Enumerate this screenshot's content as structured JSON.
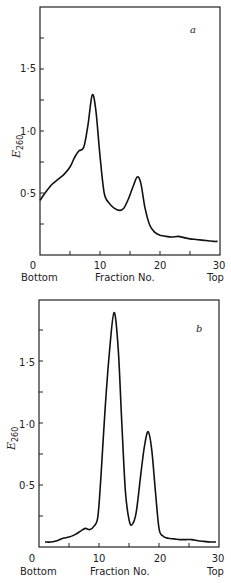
{
  "chart_data": [
    {
      "type": "line",
      "panel": "a",
      "title": "",
      "xlabel": "Fraction No.",
      "xlabel_left": "Bottom",
      "xlabel_right": "Top",
      "ylabel": "E",
      "ylabel_sub": "260",
      "xlim": [
        0,
        30
      ],
      "ylim": [
        0,
        2.0
      ],
      "xticks": [
        0,
        5,
        10,
        15,
        20,
        25,
        30
      ],
      "xtick_labels": [
        "0",
        "10",
        "20",
        "30"
      ],
      "xtick_label_values": [
        0,
        10,
        20,
        30
      ],
      "yticks": [
        0,
        0.25,
        0.5,
        0.75,
        1.0,
        1.25,
        1.5,
        1.75
      ],
      "ytick_labels": [
        "0·5",
        "1·0",
        "1·5"
      ],
      "ytick_label_values": [
        0.5,
        1.0,
        1.5
      ],
      "grid": false,
      "x": [
        0,
        1,
        2,
        3,
        4,
        5,
        5.8,
        6.5,
        7.3,
        8,
        8.7,
        9.3,
        10,
        10.7,
        11.5,
        12.3,
        13.2,
        14,
        14.8,
        15.5,
        16.2,
        16.8,
        17.5,
        18.3,
        19.2,
        20,
        21,
        22,
        23,
        24,
        25,
        26,
        27,
        28,
        29,
        29.6
      ],
      "series": [
        {
          "name": "a",
          "values": [
            0.44,
            0.51,
            0.57,
            0.61,
            0.65,
            0.71,
            0.79,
            0.84,
            0.87,
            1.05,
            1.29,
            1.17,
            0.8,
            0.5,
            0.42,
            0.38,
            0.36,
            0.38,
            0.46,
            0.55,
            0.63,
            0.58,
            0.38,
            0.24,
            0.18,
            0.16,
            0.15,
            0.145,
            0.15,
            0.14,
            0.13,
            0.125,
            0.12,
            0.115,
            0.11,
            0.11
          ]
        }
      ]
    },
    {
      "type": "line",
      "panel": "b",
      "title": "",
      "xlabel": "Fraction No.",
      "xlabel_left": "Bottom",
      "xlabel_right": "Top",
      "ylabel": "E",
      "ylabel_sub": "260",
      "xlim": [
        0,
        30
      ],
      "ylim": [
        0,
        2.0
      ],
      "xticks": [
        0,
        5,
        10,
        15,
        20,
        25,
        30
      ],
      "xtick_labels": [
        "0",
        "10",
        "20",
        "30"
      ],
      "xtick_label_values": [
        0,
        10,
        20,
        30
      ],
      "yticks": [
        0,
        0.25,
        0.5,
        0.75,
        1.0,
        1.25,
        1.5,
        1.75
      ],
      "ytick_labels": [
        "0·5",
        "1·0",
        "1·5"
      ],
      "ytick_label_values": [
        0.5,
        1.0,
        1.5
      ],
      "grid": false,
      "x": [
        1,
        2,
        3,
        4,
        5,
        6,
        7,
        7.7,
        8.5,
        9.2,
        9.8,
        10.3,
        11,
        11.7,
        12.5,
        13.2,
        13.8,
        14.4,
        15,
        15.5,
        16.2,
        17,
        17.6,
        18.2,
        18.8,
        19.4,
        20,
        20.6,
        21.5,
        22.5,
        23.5,
        24.5,
        25.5,
        26.5,
        27.5,
        28.5,
        29.5
      ],
      "series": [
        {
          "name": "b",
          "values": [
            0.04,
            0.04,
            0.05,
            0.07,
            0.08,
            0.1,
            0.13,
            0.15,
            0.14,
            0.17,
            0.24,
            0.55,
            1.1,
            1.55,
            1.89,
            1.6,
            1.0,
            0.45,
            0.22,
            0.18,
            0.28,
            0.6,
            0.82,
            0.93,
            0.78,
            0.45,
            0.15,
            0.09,
            0.07,
            0.065,
            0.06,
            0.06,
            0.06,
            0.05,
            0.045,
            0.04,
            0.04
          ]
        }
      ]
    }
  ],
  "labels": {
    "a": {
      "panel_letter": "a",
      "ylabel_main": "E",
      "ylabel_sub": "260",
      "x_zero": "0",
      "x_ten": "10",
      "x_twenty": "20",
      "x_thirty": "30",
      "y_05": "0·5",
      "y_10": "1·0",
      "y_15": "1·5",
      "bottom": "Bottom",
      "fraction": "Fraction  No.",
      "top": "Top"
    },
    "b": {
      "panel_letter": "b",
      "ylabel_main": "E",
      "ylabel_sub": "260",
      "x_zero": "0",
      "x_ten": "10",
      "x_twenty": "20",
      "x_thirty": "30",
      "y_05": "0·5",
      "y_10": "1·0",
      "y_15": "1·5",
      "bottom": "Bottom",
      "fraction": "Fraction  No.",
      "top": "Top"
    }
  },
  "colors": {
    "line": "#111111",
    "axis": "#222222",
    "background": "#ffffff"
  }
}
